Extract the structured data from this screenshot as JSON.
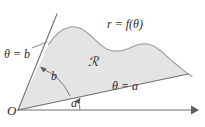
{
  "figure": {
    "kind": "polar-region-diagram",
    "background_color": "#ffffff",
    "region_fill_color": "#e4e4e4",
    "stroke_color": "#8a8a8a",
    "text_color": "#2b2b2b"
  },
  "labels": {
    "curve": "r = f(θ)",
    "region": "ℛ",
    "ray_upper": "θ = b",
    "ray_lower": "θ = a",
    "origin": "O",
    "angle_b": "b",
    "angle_a": "a"
  },
  "icons": {
    "axis_arrow": "arrow-right-icon",
    "angle_arc_a": "angle-arc-icon",
    "angle_arc_b": "angle-arc-icon"
  },
  "geometry": {
    "origin_point": [
      18,
      110
    ],
    "x_axis_end": [
      197,
      110
    ],
    "ray_a_end": [
      188,
      74
    ],
    "ray_b_end": [
      57,
      14
    ],
    "curve_peak": [
      78,
      27
    ]
  }
}
